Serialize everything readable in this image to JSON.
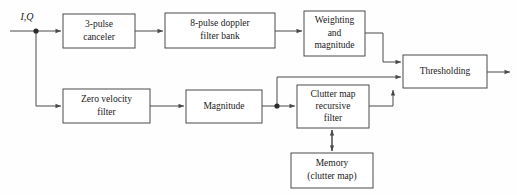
{
  "diagram": {
    "type": "block-diagram",
    "background_color": "#fefefe",
    "line_color": "#4a4a4a",
    "text_color": "#1a1a1a",
    "input_label": "I,Q",
    "blocks": [
      {
        "id": "pulse-canceler",
        "lines": [
          "3-pulse",
          "canceler"
        ],
        "line1": "3-pulse",
        "line2": "canceler",
        "line3": ""
      },
      {
        "id": "doppler-filter-bank",
        "lines": [
          "8-pulse doppler",
          "filter bank"
        ],
        "line1": "8-pulse doppler",
        "line2": "filter bank",
        "line3": ""
      },
      {
        "id": "weighting-magnitude",
        "lines": [
          "Weighting",
          "and",
          "magnitude"
        ],
        "line1": "Weighting",
        "line2": "and",
        "line3": "magnitude"
      },
      {
        "id": "thresholding",
        "lines": [
          "Thresholding"
        ],
        "line1": "Thresholding",
        "line2": "",
        "line3": ""
      },
      {
        "id": "zero-velocity-filter",
        "lines": [
          "Zero velocity",
          "filter"
        ],
        "line1": "Zero velocity",
        "line2": "filter",
        "line3": ""
      },
      {
        "id": "magnitude",
        "lines": [
          "Magnitude"
        ],
        "line1": "Magnitude",
        "line2": "",
        "line3": ""
      },
      {
        "id": "clutter-map-recursive-filter",
        "lines": [
          "Clutter map",
          "recursive",
          "filter"
        ],
        "line1": "Clutter map",
        "line2": "recursive",
        "line3": "filter"
      },
      {
        "id": "memory-clutter-map",
        "lines": [
          "Memory",
          "(clutter map)"
        ],
        "line1": "Memory",
        "line2": "(clutter map)",
        "line3": ""
      }
    ]
  }
}
